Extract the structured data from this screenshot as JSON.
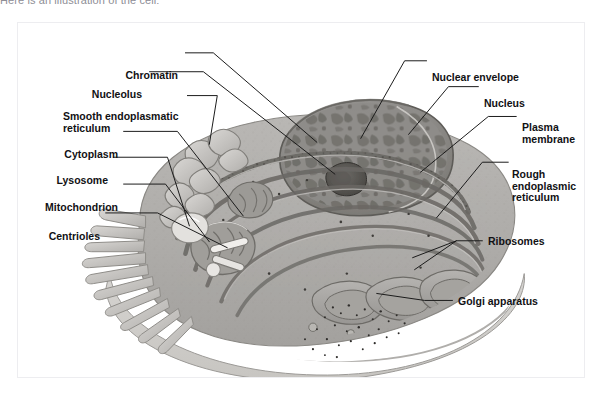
{
  "caption": {
    "text": "Here is an illustration of the cell:"
  },
  "figure": {
    "name": "animal-cell-diagram",
    "style": "grayscale textbook illustration",
    "border_color": "#ededf0",
    "background_color": "#ffffff",
    "leader_line_color": "#1a1a1a"
  },
  "labels": {
    "left": [
      {
        "id": "chromatin",
        "text": "Chromatin",
        "x": 160,
        "y": 47,
        "align": "right"
      },
      {
        "id": "nucleolus",
        "text": "Nucleolus",
        "x": 124,
        "y": 66,
        "align": "right"
      },
      {
        "id": "smooth-endoplasmatic-reticulum",
        "text": "Smooth endoplasmatic\nreticulum",
        "x": 62,
        "y": 88,
        "align": "left"
      },
      {
        "id": "cytoplasm",
        "text": "Cytoplasm",
        "x": 41,
        "y": 126,
        "align": "right"
      },
      {
        "id": "lysosome",
        "text": "Lysosome",
        "x": 31,
        "y": 152,
        "align": "right"
      },
      {
        "id": "mitochondrion",
        "text": "Mitochondrion",
        "x": 27,
        "y": 179,
        "align": "right"
      },
      {
        "id": "centrioles",
        "text": "Centrioles",
        "x": 30,
        "y": 208,
        "align": "right"
      }
    ],
    "right": [
      {
        "id": "nuclear-envelope",
        "text": "Nuclear envelope",
        "x": 414,
        "y": 55,
        "align": "left"
      },
      {
        "id": "nucleus",
        "text": "Nucleus",
        "x": 466,
        "y": 81,
        "align": "left"
      },
      {
        "id": "plasma-membrane",
        "text": "Plasma\nmembrane",
        "x": 507,
        "y": 105,
        "align": "left"
      },
      {
        "id": "rough-endoplasmic-reticulum",
        "text": "Rough\nendoplasmic\nreticulum",
        "x": 495,
        "y": 152,
        "align": "left"
      },
      {
        "id": "ribosomes",
        "text": "Ribosomes",
        "x": 470,
        "y": 236,
        "align": "left"
      },
      {
        "id": "golgi-apparatus",
        "text": "Golgi apparatus",
        "x": 440,
        "y": 296,
        "align": "left"
      }
    ]
  },
  "organelles": [
    "Chromatin",
    "Nucleolus",
    "Smooth endoplasmatic reticulum",
    "Cytoplasm",
    "Lysosome",
    "Mitochondrion",
    "Centrioles",
    "Nuclear envelope",
    "Nucleus",
    "Plasma membrane",
    "Rough endoplasmic reticulum",
    "Ribosomes",
    "Golgi apparatus"
  ]
}
